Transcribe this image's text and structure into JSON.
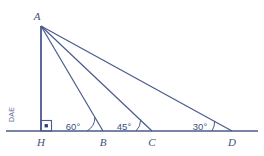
{
  "figure": {
    "stroke_color": "#4a5a8c",
    "label_color": "#3d4f80",
    "background_color": "#ffffff",
    "watermark_color": "#6a7099"
  },
  "watermark": {
    "text": "DAE"
  },
  "points": {
    "apex": {
      "label": "A",
      "x": 41,
      "y": 26
    },
    "foot": {
      "label": "H",
      "x": 41,
      "y": 131
    },
    "b": {
      "label": "B",
      "x": 103,
      "y": 131
    },
    "c": {
      "label": "C",
      "x": 152,
      "y": 131
    },
    "d": {
      "label": "D",
      "x": 232,
      "y": 131
    }
  },
  "angles": [
    {
      "at": "B",
      "label": "60°",
      "value": 60,
      "unit": "degrees"
    },
    {
      "at": "C",
      "label": "45°",
      "value": 45,
      "unit": "degrees"
    },
    {
      "at": "D",
      "label": "30°",
      "value": 30,
      "unit": "degrees"
    }
  ],
  "right_angle": {
    "at": "H",
    "label": "",
    "marker": "square-with-dot",
    "value": 90,
    "unit": "degrees"
  },
  "segments": [
    {
      "name": "AH",
      "from": "A",
      "to": "H"
    },
    {
      "name": "AB",
      "from": "A",
      "to": "B"
    },
    {
      "name": "AC",
      "from": "A",
      "to": "C"
    },
    {
      "name": "AD",
      "from": "A",
      "to": "D"
    },
    {
      "name": "baseline",
      "from": "left-edge",
      "to": "right-edge"
    }
  ]
}
